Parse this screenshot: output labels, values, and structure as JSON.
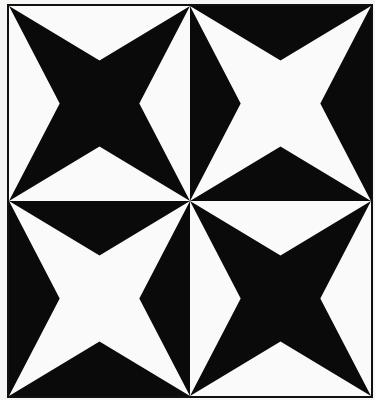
{
  "artwork": {
    "title": "Four-pointed star tiling",
    "medium": "black and white geometric print",
    "canvas": {
      "width": 375,
      "height": 400
    },
    "colors": {
      "ink": "#0a0a0a",
      "paper": "#fafafa",
      "margin": "#f6f6f4",
      "frame": "#101010"
    },
    "frame": {
      "border_width": 2,
      "margin_left": 7,
      "margin_top": 4,
      "margin_right": 2,
      "margin_bottom": 2
    },
    "grid": {
      "rows": 2,
      "columns": 2,
      "tile_count": 4
    },
    "motif": {
      "name": "concave four-pointed star",
      "points": 4,
      "point_targets": "tile corners",
      "notch_inset_percent": 28,
      "center_shape": "diamond"
    },
    "tiles": [
      {
        "id": "tile-top-left",
        "position": "top-left",
        "row": 1,
        "column": 1,
        "star_color": "#0a0a0a",
        "field_color": "#fafafa",
        "polarity": "black-star-on-white"
      },
      {
        "id": "tile-top-right",
        "position": "top-right",
        "row": 1,
        "column": 2,
        "star_color": "#fafafa",
        "field_color": "#0a0a0a",
        "polarity": "white-star-on-black"
      },
      {
        "id": "tile-bottom-left",
        "position": "bottom-left",
        "row": 2,
        "column": 1,
        "star_color": "#fafafa",
        "field_color": "#0a0a0a",
        "polarity": "white-star-on-black"
      },
      {
        "id": "tile-bottom-right",
        "position": "bottom-right",
        "row": 2,
        "column": 2,
        "star_color": "#0a0a0a",
        "field_color": "#fafafa",
        "polarity": "black-star-on-white"
      }
    ]
  }
}
